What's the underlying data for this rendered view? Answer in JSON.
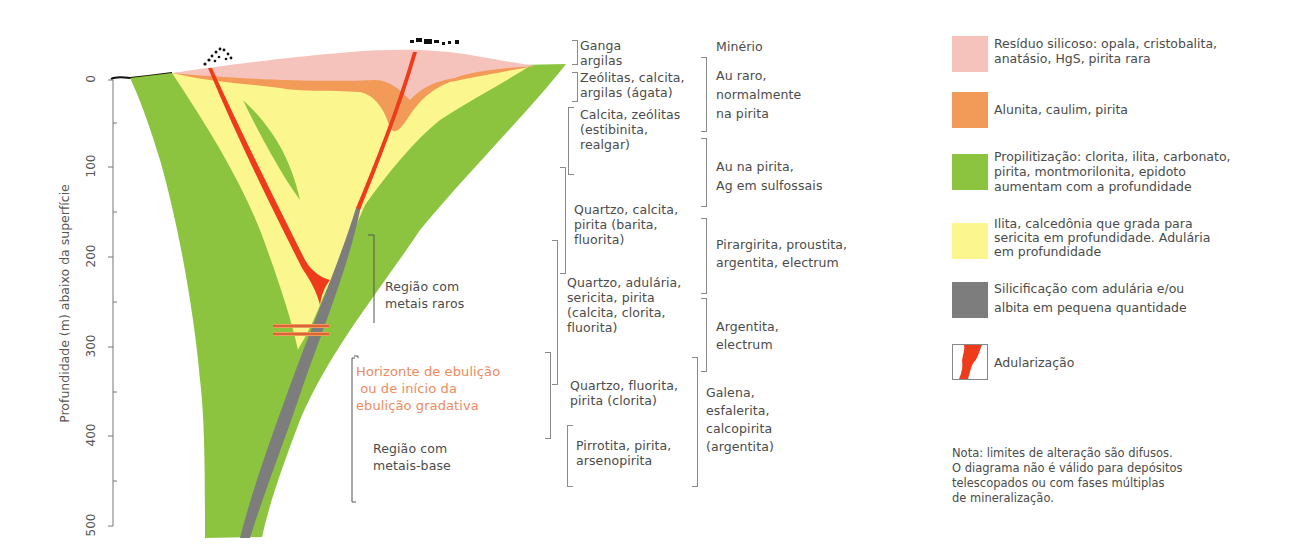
{
  "axis": {
    "title": "Profundidade (m) abaixo da superfície",
    "ticks": [
      "0",
      "100",
      "200",
      "300",
      "400",
      "500"
    ]
  },
  "colors": {
    "silica_residue": "#f6c3bc",
    "alunite": "#f29a58",
    "propylitic": "#8cc43f",
    "illite": "#fbf78e",
    "silicification": "#7d7d7d",
    "adularization": "#ee3b1c",
    "surface_line": "#111111",
    "ebullition_label": "#ee8a5e"
  },
  "regions": {
    "rare_metals": "Região com\nmetais raros",
    "ebullition": "Horizonte de ebulição\n ou de início da\nebulição gradativa",
    "base_metals": "Região com\nmetais-base"
  },
  "gangue": [
    {
      "text": "Ganga\nargilas"
    },
    {
      "text": "Zeólitas, calcita,\nargilas (ágata)"
    },
    {
      "text": "Calcita, zeólitas\n(estibinita,\nrealgar)"
    },
    {
      "text": "Quartzo, calcita,\npirita (barita,\nfluorita)"
    },
    {
      "text": "Quartzo, adulária,\nsericita, pirita\n(calcita, clorita,\nfluorita)"
    },
    {
      "text": "Quartzo, fluorita,\npirita (clorita)"
    },
    {
      "text": "Pirrotita, pirita,\narsenopirita"
    }
  ],
  "ore": {
    "header": "Minério",
    "items": [
      {
        "text": "Au raro,\nnormalmente\nna pirita"
      },
      {
        "text": "Au na pirita,\nAg em sulfossais"
      },
      {
        "text": "Pirargirita, proustita,\nargentita, electrum"
      },
      {
        "text": "Argentita,\nelectrum"
      },
      {
        "text": "Galena,\nesfalerita,\ncalcopirita\n(argentita)"
      }
    ]
  },
  "legend": [
    {
      "key": "silica_residue",
      "text": "Resíduo silicoso: opala, cristobalita,\nanatásio, HgS, pirita rara"
    },
    {
      "key": "alunite",
      "text": "Alunita, caulim, pirita"
    },
    {
      "key": "propylitic",
      "text": "Propilitização: clorita, ilita, carbonato,\npirita, montmorilonita, epidoto\naumentam com a profundidade"
    },
    {
      "key": "illite",
      "text": "Ilita, calcedônia que grada para\nsericita em profundidade. Adulária\nem profundidade"
    },
    {
      "key": "silicification",
      "text": "Silicificação com adulária e/ou\nalbita em pequena quantidade"
    },
    {
      "key": "adularization",
      "text": "Adularização"
    }
  ],
  "note": "Nota: limites de alteração são difusos.\nO diagrama não é válido para depósitos\ntelescopados ou com fases múltiplas\nde mineralização."
}
